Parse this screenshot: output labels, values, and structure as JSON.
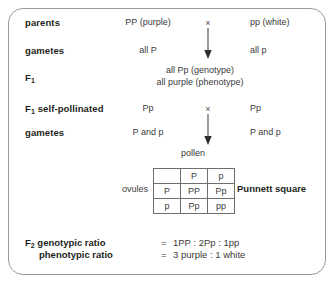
{
  "diagram": {
    "rows": [
      {
        "label": "parents",
        "label_sub": "",
        "left": "PP (purple)",
        "cross": "×",
        "right": "pp (white)"
      },
      {
        "label": "gametes",
        "label_sub": "",
        "left": "all P",
        "cross": "",
        "right": "all p"
      },
      {
        "label": "F",
        "label_sub": "1",
        "left": "",
        "cross": "",
        "right": ""
      },
      {
        "label": " self-pollinated",
        "label_sub": "1",
        "left": "Pp",
        "cross": "×",
        "right": "Pp"
      },
      {
        "label": "gametes",
        "label_sub": "",
        "left": "P and p",
        "cross": "",
        "right": "P and p"
      }
    ],
    "f1_result": {
      "genotype_line": "all Pp (genotype)",
      "phenotype_line": "all purple (phenotype)"
    },
    "f1_label_text": "F",
    "f1_label_sub": "1",
    "f1_self_label_text": "F",
    "f1_self_label_sub": "1",
    "f1_self_label_rest": " self-pollinated",
    "pollen_label": "pollen",
    "ovules_label": "ovules",
    "punnett_square_label": "Punnett square",
    "punnett_grid": {
      "corner": "",
      "column_headers": [
        "P",
        "p"
      ],
      "row_headers": [
        "P",
        "p"
      ],
      "cells": [
        [
          "PP",
          "Pp"
        ],
        [
          "Pp",
          "pp"
        ]
      ]
    },
    "ratios": [
      {
        "label_text": "F",
        "label_sub": "2",
        "label_rest": " genotypic ratio",
        "equals": "=",
        "value": "1PP : 2Pp : 1pp"
      },
      {
        "label_text": "",
        "label_sub": "",
        "label_rest": "phenotypic ratio",
        "equals": "=",
        "value": "3 purple : 1 white"
      }
    ]
  },
  "colors": {
    "border": "#9a9a9a",
    "text": "#231f20",
    "value_text": "#3b3b3b",
    "grid_line": "#6e6e6e"
  }
}
